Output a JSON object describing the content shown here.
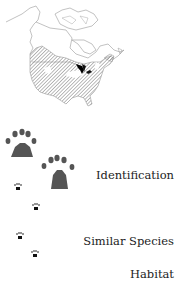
{
  "map": {
    "label": "range-map-north-america",
    "range_pattern": "diagonal-hatch",
    "stroke_color": "#888888",
    "great_lakes_color": "#000000"
  },
  "tracks": {
    "large_prints": 2,
    "small_prints": 4,
    "large_color": "#555555",
    "small_color": "#111111"
  },
  "nav": {
    "items": [
      {
        "label": "Identification"
      },
      {
        "label": "Similar Species"
      },
      {
        "label": "Habitat"
      }
    ]
  }
}
